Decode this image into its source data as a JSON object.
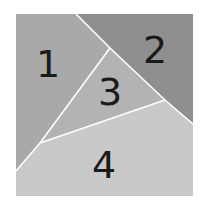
{
  "diagram": {
    "type": "square-partition",
    "background": "#ffffff",
    "divider_color": "#ffffff",
    "square": {
      "x": 16,
      "y": 14,
      "width": 177,
      "height": 182
    },
    "regions": [
      {
        "id": "1",
        "label": "1",
        "color": "#a9a9a9",
        "points": "16,14 76,14 110,48 40,143 16,171",
        "label_pos": {
          "x": 48,
          "y": 64
        }
      },
      {
        "id": "2",
        "label": "2",
        "color": "#8f8f8f",
        "points": "76,14 193,14 193,124 165,100 110,48",
        "label_pos": {
          "x": 155,
          "y": 50
        }
      },
      {
        "id": "3",
        "label": "3",
        "color": "#b3b3b3",
        "points": "110,48 165,100 40,143",
        "label_pos": {
          "x": 110,
          "y": 92
        }
      },
      {
        "id": "4",
        "label": "4",
        "color": "#c9c9c9",
        "points": "16,171 40,143 165,100 193,124 193,196 16,196",
        "label_pos": {
          "x": 104,
          "y": 165
        }
      }
    ],
    "dividers": [
      {
        "name": "divider-1-2",
        "points": "76,14 110,48 165,100 193,124"
      },
      {
        "name": "divider-1-3-4",
        "points": "110,48 40,143 16,171"
      },
      {
        "name": "divider-3-4",
        "points": "40,143 165,100"
      }
    ]
  }
}
